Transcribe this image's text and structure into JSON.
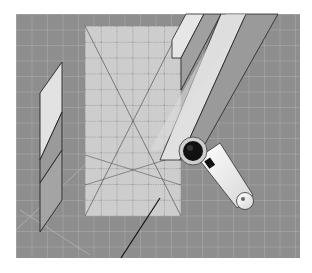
{
  "illustration": {
    "subject": "rotary cutter cutting fabric strips along a quilting ruler on a cutting mat",
    "colors": {
      "background": "#ffffff",
      "mat": "#8e8e8e",
      "mat_grid": "#b4b4b4",
      "ruler": "#cfcfcf",
      "ruler_marks": "#555555",
      "strip_light": "#d8d8d8",
      "strip_dark": "#9a9a9a",
      "cutter_handle": "#f2f2f2",
      "cutter_blade": "#111111",
      "outline": "#222222"
    },
    "elements": [
      "cutting-mat",
      "quilting-ruler",
      "fabric-strips",
      "cut-fabric-pieces",
      "rotary-cutter",
      "cut-line"
    ]
  }
}
